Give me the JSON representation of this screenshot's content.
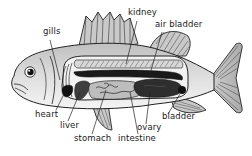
{
  "diagram": {
    "labels": [
      {
        "id": "gills",
        "text": "gills",
        "x": 43,
        "y": 30
      },
      {
        "id": "kidney",
        "text": "kidney",
        "x": 128,
        "y": 11
      },
      {
        "id": "air-bladder",
        "text": "air bladder",
        "x": 155,
        "y": 22
      },
      {
        "id": "heart",
        "text": "heart",
        "x": 33,
        "y": 112
      },
      {
        "id": "liver",
        "text": "liver",
        "x": 58,
        "y": 123
      },
      {
        "id": "stomach",
        "text": "stomach",
        "x": 74,
        "y": 136
      },
      {
        "id": "intestine",
        "text": "intestine",
        "x": 118,
        "y": 136
      },
      {
        "id": "ovary",
        "text": "ovary",
        "x": 137,
        "y": 125
      },
      {
        "id": "bladder",
        "text": "bladder",
        "x": 164,
        "y": 114
      }
    ],
    "colors": {
      "outline": "#222222",
      "body_light": "#e6e6e6",
      "body_mid": "#bdbdbd",
      "organ_dark": "#3a3a3a",
      "organ_black": "#111111",
      "fin": "#c8c8c8"
    }
  }
}
